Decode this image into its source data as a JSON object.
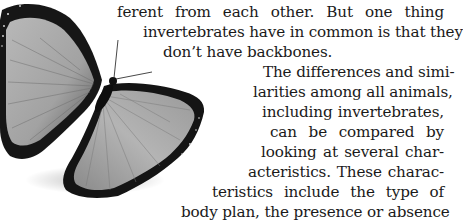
{
  "text": {
    "lines": [
      "ferent from each other. But one thing",
      "invertebrates have in common is that they",
      "don’t have backbones.",
      "The differences and simi-",
      "larities among all animals,",
      "including invertebrates,",
      "can be compared by",
      "looking at several char-",
      "acteristics. These charac-",
      "teristics include the type of",
      "body plan, the presence or absence"
    ]
  }
}
